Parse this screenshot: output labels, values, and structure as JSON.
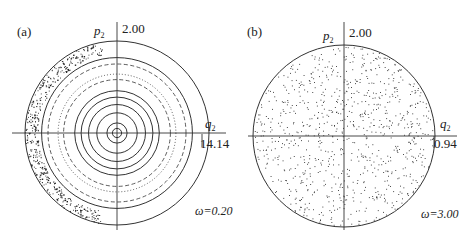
{
  "chart_data": [
    {
      "type": "scatter",
      "panel_label": "(a)",
      "title": "Poincaré section, omega = 0.20 (regular KAM tori with chaotic outer layer)",
      "xlabel": "q2",
      "ylabel": "p2",
      "x_axis_max_label": "14.14",
      "y_axis_max_label": "2.00",
      "annotation": "ω=0.20",
      "omega": 0.2,
      "grid": false,
      "rings": [
        {
          "r": 0.05,
          "style": "solid"
        },
        {
          "r": 0.11,
          "style": "solid"
        },
        {
          "r": 0.22,
          "style": "solid"
        },
        {
          "r": 0.31,
          "style": "solid"
        },
        {
          "r": 0.39,
          "style": "solid"
        },
        {
          "r": 0.46,
          "style": "solid"
        },
        {
          "r": 0.58,
          "style": "dashed"
        },
        {
          "r": 0.64,
          "style": "dotted"
        },
        {
          "r": 0.75,
          "style": "dashed"
        },
        {
          "r": 0.82,
          "style": "solid"
        },
        {
          "r": 1.0,
          "style": "solid"
        }
      ],
      "chaotic_layer": {
        "side": "left",
        "r_min": 0.86,
        "r_max": 1.0,
        "angle_range_deg": [
          100,
          260
        ]
      }
    },
    {
      "type": "scatter",
      "panel_label": "(b)",
      "title": "Poincaré section, omega = 3.00 (fully chaotic, points fill disk)",
      "xlabel": "q2",
      "ylabel": "p2",
      "x_axis_max_label": "0.94",
      "y_axis_max_label": "2.00",
      "annotation": "ω=3.00",
      "omega": 3.0,
      "grid": false,
      "rings": [
        {
          "r": 1.0,
          "style": "solid"
        }
      ],
      "scatter_fill": {
        "distribution": "uniform-disk",
        "approx_points": 900
      }
    }
  ],
  "panels": {
    "a": {
      "label": "(a)",
      "p_label": "p",
      "p_sub": "2",
      "q_label": "q",
      "q_sub": "2",
      "y_max": "2.00",
      "x_max": "14.14",
      "omega_text": "ω=0.20"
    },
    "b": {
      "label": "(b)",
      "p_label": "p",
      "p_sub": "2",
      "q_label": "q",
      "q_sub": "2",
      "y_max": "2.00",
      "x_max": "0.94",
      "omega_text": "ω=3.00"
    }
  },
  "colors": {
    "line": "#333333",
    "points": "#222222",
    "background": "#ffffff"
  }
}
